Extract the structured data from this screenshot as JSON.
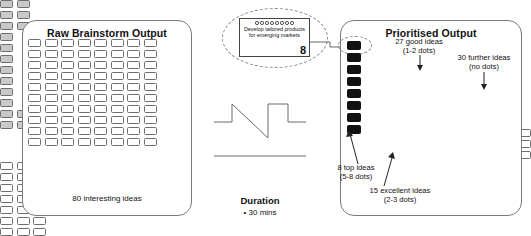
{
  "raw_panel": {
    "title": "Raw Brainstorm Output",
    "caption": "80 interesting ideas",
    "grid_columns": 8,
    "grid_rows": 10,
    "box_count": 80
  },
  "callout": {
    "dot_count": 8,
    "text": "Develop tailored products for emerging markets",
    "score": "8"
  },
  "duration": {
    "title": "Duration",
    "bullet": "•",
    "item": "30 mins"
  },
  "prioritised_panel": {
    "title": "Prioritised Output",
    "groups": [
      {
        "name": "top-ideas",
        "label_line1": "8 top ideas",
        "label_line2": "(5-8 dots)",
        "count": 8,
        "fill": "#111111"
      },
      {
        "name": "excellent-ideas",
        "label_line1": "15 excellent ideas",
        "label_line2": "(2-3 dots)",
        "count": 15,
        "fill": "#c9c9c9"
      },
      {
        "name": "good-ideas",
        "label_line1": "27 good ideas",
        "label_line2": "(1-2 dots)",
        "count": 27,
        "fill": "#ffffff"
      },
      {
        "name": "further-ideas",
        "label_line1": "30 further ideas",
        "label_line2": "(no dots)",
        "count": 30,
        "fill": "#ffffff"
      }
    ]
  },
  "colors": {
    "stroke": "#6e6e6e",
    "panel_border": "#7a7a7a",
    "black_fill": "#111111",
    "grey_fill": "#c9c9c9",
    "white_fill": "#ffffff",
    "dashed": "#8a8a8a"
  }
}
